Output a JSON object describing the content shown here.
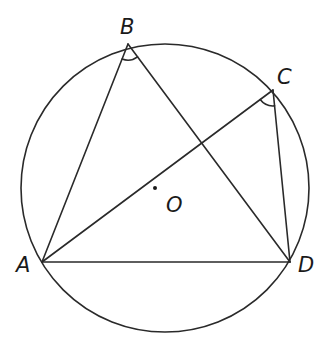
{
  "diagram": {
    "type": "circle-inscribed-quadrilateral",
    "colors": {
      "stroke": "#2a2a2a",
      "label": "#1a1a1a",
      "background": "#ffffff"
    },
    "circle": {
      "center_label": "O",
      "cx": 165,
      "cy": 188,
      "r": 144
    },
    "points": {
      "A": {
        "label": "A",
        "x": 42,
        "y": 262
      },
      "B": {
        "label": "B",
        "x": 128,
        "y": 44
      },
      "C": {
        "label": "C",
        "x": 273,
        "y": 90
      },
      "D": {
        "label": "D",
        "x": 290,
        "y": 262
      },
      "O": {
        "label": "O",
        "x": 166,
        "y": 188
      }
    },
    "segments": [
      "AB",
      "BD",
      "AC",
      "CD",
      "AD"
    ],
    "marked_angles": [
      "ABD",
      "ACD"
    ]
  }
}
